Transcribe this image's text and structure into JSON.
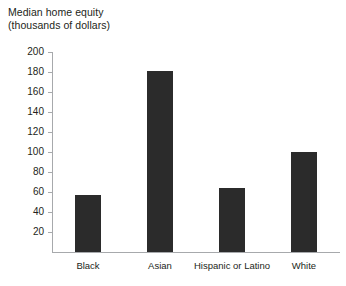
{
  "chart_data": {
    "type": "bar",
    "title": "Median home equity",
    "title_line1": "Median home equity",
    "title_line2": "(thousands of dollars)",
    "subtitle": "(thousands of dollars)",
    "xlabel": "",
    "ylabel": "thousands of dollars",
    "categories": [
      "Black",
      "Asian",
      "Hispanic or Latino",
      "White"
    ],
    "values": [
      57,
      181,
      64,
      100
    ],
    "ylim": [
      0,
      200
    ],
    "ytick_step": 20,
    "yticks": [
      20,
      40,
      60,
      80,
      100,
      120,
      140,
      160,
      180,
      200
    ],
    "ytick_labels": [
      "20",
      "40",
      "60",
      "80",
      "100",
      "120",
      "140",
      "160",
      "180",
      "200"
    ],
    "grid": false,
    "legend": null,
    "bar_color": "#2b2b2b",
    "axis_color": "#a7a9ac",
    "text_color": "#231f20",
    "background_color": "#ffffff"
  }
}
